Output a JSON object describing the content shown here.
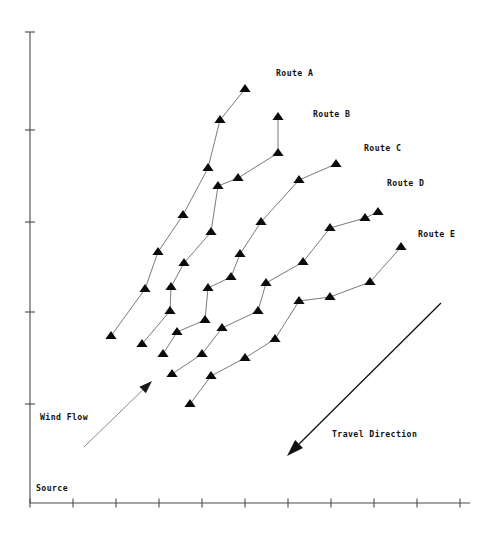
{
  "figure": {
    "background_color": "#ffffff",
    "axis_color": "#4a4a4a",
    "marker_color": "#0b0b0b",
    "line_color": "#6b6b6b",
    "wind_arrow_color": "#8a8a8a",
    "travel_arrow_color": "#111111"
  },
  "axes": {
    "origin_label": "Source",
    "y_axis": {
      "x": 30,
      "y_top": 32,
      "y_bottom": 503,
      "tick_length": 10,
      "ticks": [
        32,
        130,
        222,
        312,
        404
      ]
    },
    "x_axis": {
      "y": 503,
      "x_left": 30,
      "x_right": 470,
      "tick_length": 9,
      "ticks": [
        30,
        73,
        116,
        159,
        202,
        245,
        288,
        331,
        374,
        417,
        460
      ]
    }
  },
  "annotations": {
    "wind_flow": {
      "label": "Wind Flow",
      "label_x": 40,
      "label_y": 420,
      "tail_x": 84,
      "tail_y": 447,
      "head_x": 152,
      "head_y": 381
    },
    "travel_direction": {
      "label": "Travel Direction",
      "label_x": 332,
      "label_y": 437,
      "tail_x": 441,
      "tail_y": 303,
      "head_x": 287,
      "head_y": 456
    }
  },
  "chart_data": {
    "type": "line",
    "title": "",
    "xlabel": "",
    "ylabel": "",
    "grid": false,
    "legend": "inline-end-labels",
    "axis_note": "Unlabeled ticks; origin annotated 'Source'",
    "xlim": [
      30,
      470
    ],
    "ylim": [
      503,
      32
    ],
    "series": [
      {
        "name": "Route A",
        "label_x": 276,
        "label_y": 76,
        "points": [
          {
            "x": 111,
            "y": 336
          },
          {
            "x": 145,
            "y": 289
          },
          {
            "x": 158,
            "y": 252
          },
          {
            "x": 183,
            "y": 215
          },
          {
            "x": 208,
            "y": 168
          },
          {
            "x": 220,
            "y": 120
          },
          {
            "x": 245,
            "y": 89
          }
        ]
      },
      {
        "name": "Route B",
        "label_x": 313,
        "label_y": 117,
        "points": [
          {
            "x": 142,
            "y": 344
          },
          {
            "x": 170,
            "y": 311
          },
          {
            "x": 171,
            "y": 287
          },
          {
            "x": 184,
            "y": 263
          },
          {
            "x": 211,
            "y": 232
          },
          {
            "x": 218,
            "y": 186
          },
          {
            "x": 238,
            "y": 178
          },
          {
            "x": 278,
            "y": 153
          },
          {
            "x": 278,
            "y": 117
          }
        ]
      },
      {
        "name": "Route C",
        "label_x": 364,
        "label_y": 151,
        "points": [
          {
            "x": 163,
            "y": 354
          },
          {
            "x": 177,
            "y": 332
          },
          {
            "x": 205,
            "y": 320
          },
          {
            "x": 208,
            "y": 288
          },
          {
            "x": 231,
            "y": 277
          },
          {
            "x": 240,
            "y": 254
          },
          {
            "x": 261,
            "y": 222
          },
          {
            "x": 299,
            "y": 180
          },
          {
            "x": 336,
            "y": 164
          }
        ]
      },
      {
        "name": "Route D",
        "label_x": 387,
        "label_y": 186,
        "points": [
          {
            "x": 172,
            "y": 374
          },
          {
            "x": 202,
            "y": 354
          },
          {
            "x": 222,
            "y": 328
          },
          {
            "x": 258,
            "y": 311
          },
          {
            "x": 266,
            "y": 283
          },
          {
            "x": 303,
            "y": 262
          },
          {
            "x": 330,
            "y": 228
          },
          {
            "x": 365,
            "y": 218
          },
          {
            "x": 378,
            "y": 212
          }
        ]
      },
      {
        "name": "Route E",
        "label_x": 418,
        "label_y": 237,
        "points": [
          {
            "x": 190,
            "y": 404
          },
          {
            "x": 211,
            "y": 376
          },
          {
            "x": 245,
            "y": 358
          },
          {
            "x": 275,
            "y": 339
          },
          {
            "x": 299,
            "y": 301
          },
          {
            "x": 330,
            "y": 297
          },
          {
            "x": 370,
            "y": 282
          },
          {
            "x": 401,
            "y": 247
          }
        ]
      }
    ]
  }
}
